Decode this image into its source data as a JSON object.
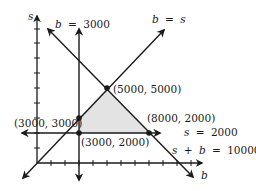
{
  "diagram": {
    "type": "linear-programming-feasible-region",
    "axes": {
      "x_label": "b",
      "y_label": "s"
    },
    "lines": [
      {
        "id": "b3000",
        "label_var": "b",
        "label_eq": "=",
        "label_val": "3000"
      },
      {
        "id": "bs",
        "label_var": "b",
        "label_eq": "=",
        "label_var2": "s"
      },
      {
        "id": "s2000",
        "label_var": "s",
        "label_eq": "=",
        "label_val": "2000"
      },
      {
        "id": "sum",
        "label_var": "s",
        "label_plus": "+",
        "label_var2": "b",
        "label_eq": "=",
        "label_val": "10000"
      }
    ],
    "vertices": [
      {
        "label": "(3000, 3000)",
        "b": 3000,
        "s": 3000
      },
      {
        "label": "(5000, 5000)",
        "b": 5000,
        "s": 5000
      },
      {
        "label": "(8000, 2000)",
        "b": 8000,
        "s": 2000
      },
      {
        "label": "(3000, 2000)",
        "b": 3000,
        "s": 2000
      }
    ],
    "colors": {
      "line": "#1a1a1a",
      "region": "#e3e3e3"
    }
  }
}
